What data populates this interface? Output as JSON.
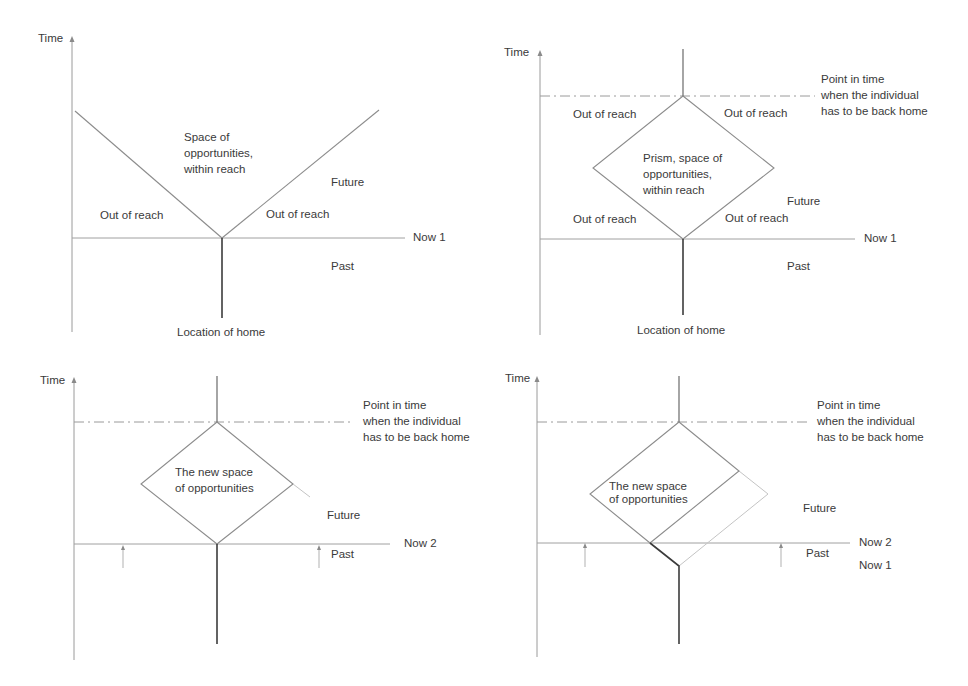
{
  "figure": {
    "colors": {
      "background": "#ffffff",
      "lines": "#8c8c8c",
      "home_trajectory": "#3c3c3c",
      "text": "#3a3a3a"
    }
  },
  "panels": [
    {
      "id": "panel-1",
      "axis_label": "Time",
      "now_label": "Now 1",
      "cone_label": [
        "Space of",
        "opportunities,",
        "within reach"
      ],
      "out_of_reach_left": "Out of reach",
      "out_of_reach_right": "Out of reach",
      "future_label": "Future",
      "past_label": "Past",
      "home_label": "Location of home"
    },
    {
      "id": "panel-2",
      "axis_label": "Time",
      "now_label": "Now 1",
      "deadline_label": [
        "Point in time",
        "when the individual",
        "has to be back home"
      ],
      "prism_label": [
        "Prism, space of",
        "opportunities,",
        "within reach"
      ],
      "out_of_reach_top_left": "Out of reach",
      "out_of_reach_top_right": "Out of reach",
      "out_of_reach_bottom_left": "Out of reach",
      "out_of_reach_bottom_right": "Out of reach",
      "future_label": "Future",
      "past_label": "Past",
      "home_label": "Location of home"
    },
    {
      "id": "panel-3",
      "axis_label": "Time",
      "now_label": "Now 2",
      "deadline_label": [
        "Point in time",
        "when the individual",
        "has to be back home"
      ],
      "prism_label": [
        "The new space",
        "of opportunities"
      ],
      "future_label": "Future",
      "past_label": "Past"
    },
    {
      "id": "panel-4",
      "axis_label": "Time",
      "now_label": "Now 2",
      "now_prev_label": "Now 1",
      "deadline_label": [
        "Point in time",
        "when the individual",
        "has to be back home"
      ],
      "prism_label": [
        "The new space",
        "of opportunities"
      ],
      "future_label": "Future",
      "past_label": "Past"
    }
  ]
}
